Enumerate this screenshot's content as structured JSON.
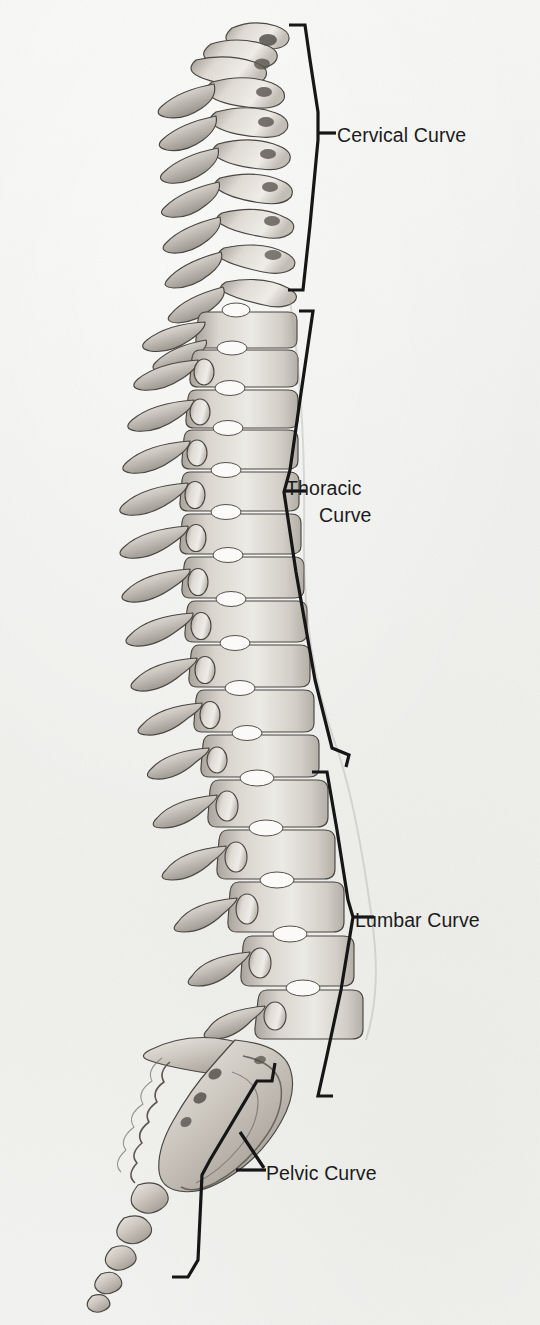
{
  "figure": {
    "background_color": "#f0f0ee",
    "ink_color": "#1b1b1b",
    "bone_light": "#e8e6e2",
    "bone_mid": "#bdb9b2",
    "bone_dark": "#6e6a64",
    "disc_color": "#fbfaf8"
  },
  "labels": {
    "cervical": {
      "text": "Cervical Curve",
      "lines": [
        "Cervical Curve"
      ]
    },
    "thoracic": {
      "text": "Thoracic Curve",
      "lines": [
        "Thoracic",
        "Curve"
      ]
    },
    "lumbar": {
      "text": "Lumbar Curve",
      "lines": [
        "Lumbar Curve"
      ]
    },
    "pelvic": {
      "text": "Pelvic Curve",
      "lines": [
        "Pelvic Curve"
      ]
    }
  },
  "regions": [
    {
      "id": "cervical",
      "label": "Cervical Curve",
      "vertebrae": 7,
      "bracket": "concave-left"
    },
    {
      "id": "thoracic",
      "label": "Thoracic Curve",
      "vertebrae": 12,
      "bracket": "concave-right"
    },
    {
      "id": "lumbar",
      "label": "Lumbar Curve",
      "vertebrae": 5,
      "bracket": "convex-right"
    },
    {
      "id": "pelvic",
      "label": "Pelvic Curve",
      "vertebrae": 9,
      "bracket": "diagonal"
    }
  ]
}
